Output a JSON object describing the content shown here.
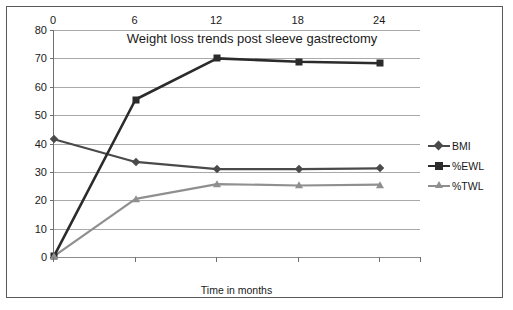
{
  "chart_data": {
    "type": "line",
    "title": "Weight loss trends post sleeve gastrectomy",
    "xlabel": "Time in months",
    "ylabel": "",
    "x": [
      0,
      6,
      12,
      18,
      24
    ],
    "categories": [
      "0",
      "6",
      "12",
      "18",
      "24"
    ],
    "xlim": [
      0,
      27
    ],
    "ylim": [
      0,
      80
    ],
    "ytick_labels": [
      "0",
      "10",
      "20",
      "30",
      "40",
      "50",
      "60",
      "70",
      "80"
    ],
    "ytick_values": [
      0,
      10,
      20,
      30,
      40,
      50,
      60,
      70,
      80
    ],
    "grid": "horizontal",
    "legend_position": "right",
    "series": [
      {
        "name": "BMI",
        "marker": "diamond",
        "color": "#4a4a4a",
        "values": [
          41.5,
          33.5,
          31.0,
          31.0,
          31.2
        ]
      },
      {
        "name": "%EWL",
        "marker": "square",
        "color": "#2b2b2b",
        "values": [
          0.3,
          55.5,
          70.0,
          68.8,
          68.3
        ]
      },
      {
        "name": "%TWL",
        "marker": "triangle",
        "color": "#8f8f8f",
        "values": [
          0.3,
          20.5,
          25.7,
          25.2,
          25.5
        ]
      }
    ]
  },
  "colors": {
    "bmi": "#4a4a4a",
    "ewl": "#2b2b2b",
    "twl": "#8f8f8f",
    "grid": "#a9a9a9",
    "axis": "#707070",
    "frame": "#5a5a5a",
    "text": "#1a1a1a",
    "background": "#ffffff"
  }
}
